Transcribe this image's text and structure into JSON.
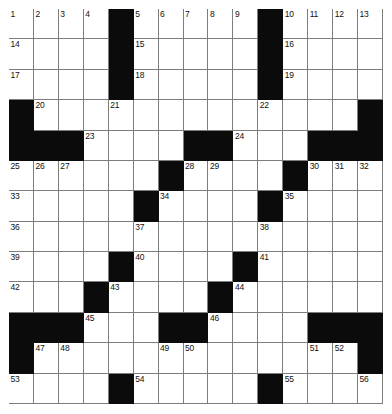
{
  "puzzle": {
    "type": "crossword-grid",
    "columns": 15,
    "rows": 13,
    "colors": {
      "background": "#ffffff",
      "block": "#0b0b0b",
      "cell": "#ffffff",
      "rule": "#7d7d7d",
      "number": "#111111"
    },
    "grid": [
      [
        "1",
        "2",
        "3",
        "4",
        "#",
        "5",
        "6",
        "7",
        "8",
        "9",
        "#",
        "10",
        "11",
        "12",
        "13"
      ],
      [
        "14",
        "",
        "",
        "",
        "#",
        "15",
        "",
        "",
        "",
        "",
        "#",
        "16",
        "",
        "",
        ""
      ],
      [
        "17",
        "",
        "",
        "",
        "#",
        "18",
        "",
        "",
        "",
        "",
        "#",
        "19",
        "",
        "",
        ""
      ],
      [
        "#",
        "20",
        "",
        "",
        "21",
        "",
        "",
        "",
        "",
        "",
        "22",
        "",
        "",
        "",
        "#"
      ],
      [
        "#",
        "#",
        "#",
        "23",
        "",
        "",
        "",
        "#",
        "#",
        "24",
        "",
        "",
        "#",
        "#",
        "#"
      ],
      [
        "25",
        "26",
        "27",
        "",
        "",
        "",
        "#",
        "28",
        "29",
        "",
        "",
        "#",
        "30",
        "31",
        "32"
      ],
      [
        "33",
        "",
        "",
        "",
        "",
        "#",
        "34",
        "",
        "",
        "",
        "#",
        "35",
        "",
        "",
        ""
      ],
      [
        "36",
        "",
        "",
        "",
        "",
        "37",
        "",
        "",
        "",
        "",
        "38",
        "",
        "",
        "",
        ""
      ],
      [
        "39",
        "",
        "",
        "",
        "#",
        "40",
        "",
        "",
        "",
        "#",
        "41",
        "",
        "",
        "",
        ""
      ],
      [
        "42",
        "",
        "",
        "#",
        "43",
        "",
        "",
        "",
        "#",
        "44",
        "",
        "",
        "",
        "",
        ""
      ],
      [
        "#",
        "#",
        "#",
        "45",
        "",
        "",
        "#",
        "#",
        "46",
        "",
        "",
        "",
        "#",
        "#",
        "#"
      ],
      [
        "#",
        "47",
        "48",
        "",
        "",
        "",
        "49",
        "50",
        "",
        "",
        "",
        "",
        "51",
        "52",
        "#"
      ],
      [
        "53",
        "",
        "",
        "",
        "#",
        "54",
        "",
        "",
        "",
        "",
        "#",
        "55",
        "",
        "",
        "56"
      ],
      [
        "57",
        "",
        "",
        "",
        "#",
        "58",
        "",
        "",
        "",
        "",
        "#",
        "59",
        "",
        "",
        ""
      ],
      [
        "60",
        "",
        "",
        "",
        "#",
        "61",
        "",
        "",
        "",
        "",
        "#",
        "62",
        "",
        "",
        ""
      ]
    ],
    "numbers_present": [
      "1",
      "2",
      "3",
      "4",
      "5",
      "6",
      "7",
      "8",
      "9",
      "10",
      "11",
      "12",
      "13",
      "14",
      "15",
      "16",
      "17",
      "18",
      "19",
      "20",
      "21",
      "22",
      "23",
      "24",
      "25",
      "26",
      "27",
      "28",
      "29",
      "30",
      "31",
      "32",
      "33",
      "34",
      "35",
      "36",
      "37",
      "38",
      "39",
      "40",
      "41",
      "42",
      "43",
      "44",
      "45",
      "46",
      "47",
      "48",
      "49",
      "50",
      "51",
      "52",
      "53",
      "54",
      "55",
      "56",
      "57",
      "58",
      "59",
      "60",
      "61",
      "62"
    ]
  }
}
